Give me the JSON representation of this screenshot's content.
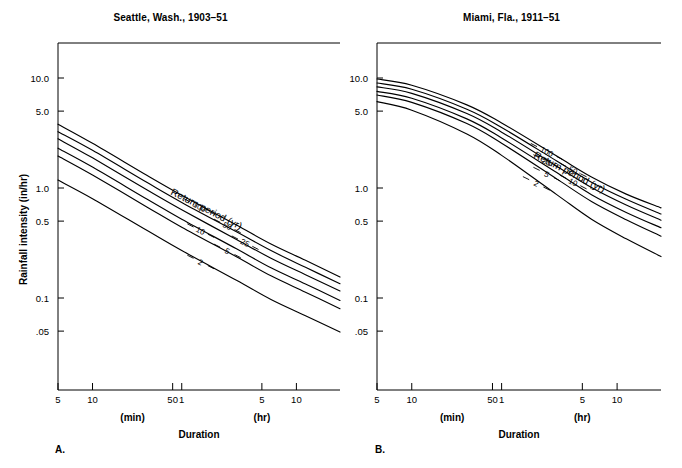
{
  "figure": {
    "ylabel": "Rainfall intensity (in/hr)",
    "xlabel": "Duration",
    "x_unit_min": "(min)",
    "x_unit_hr": "(hr)",
    "return_period_label": "Return period (yr)"
  },
  "panels": [
    {
      "letter": "A.",
      "title": "Seattle, Wash., 1903–51",
      "y_ticks": [
        "10.0",
        "5.0",
        "1.0",
        "0.5",
        "0.1",
        ".05"
      ],
      "x_ticks_min": [
        "5",
        "10",
        "50"
      ],
      "x_ticks_hr": [
        "1",
        "5",
        "10"
      ],
      "curve_labels": [
        "100",
        "50",
        "25",
        "10",
        "5",
        "2"
      ]
    },
    {
      "letter": "B.",
      "title": "Miami, Fla., 1911–51",
      "y_ticks": [
        "10.0",
        "5.0",
        "1.0",
        "0.5",
        "0.1",
        ".05"
      ],
      "x_ticks_min": [
        "5",
        "10",
        "50"
      ],
      "x_ticks_hr": [
        "1",
        "5",
        "10"
      ],
      "curve_labels": [
        "100",
        "50",
        "25",
        "10",
        "5",
        "2"
      ]
    }
  ],
  "chart_data": {
    "type": "line",
    "xlabel": "Duration",
    "ylabel": "Rainfall intensity (in/hr)",
    "xscale": "log",
    "yscale": "log",
    "grid": false,
    "legend": "inline curve labels",
    "x_tick_values_minutes": [
      5,
      10,
      50,
      60,
      300,
      600
    ],
    "x_tick_labels": [
      "5",
      "10",
      "50",
      "1",
      "5",
      "10"
    ],
    "y_tick_values": [
      10.0,
      5.0,
      1.0,
      0.5,
      0.1,
      0.05
    ],
    "y_tick_labels": [
      "10.0",
      "5.0",
      "1.0",
      "0.5",
      "0.1",
      ".05"
    ],
    "ylim": [
      0.03,
      20.0
    ],
    "xlim_minutes": [
      5,
      1440
    ],
    "panels": [
      {
        "name": "Seattle, Wash., 1903–51",
        "letter": "A.",
        "x_minutes": [
          5,
          10,
          30,
          60,
          180,
          360,
          720,
          1440
        ],
        "series": [
          {
            "name": "100",
            "return_period_yr": 100,
            "values": [
              3.8,
              2.55,
              1.3,
              0.86,
              0.46,
              0.31,
              0.22,
              0.155
            ]
          },
          {
            "name": "50",
            "return_period_yr": 50,
            "values": [
              3.25,
              2.2,
              1.12,
              0.74,
              0.4,
              0.27,
              0.19,
              0.135
            ]
          },
          {
            "name": "25",
            "return_period_yr": 25,
            "values": [
              2.8,
              1.88,
              0.96,
              0.635,
              0.34,
              0.23,
              0.163,
              0.116
            ]
          },
          {
            "name": "10",
            "return_period_yr": 10,
            "values": [
              2.3,
              1.55,
              0.79,
              0.52,
              0.28,
              0.188,
              0.134,
              0.095
            ]
          },
          {
            "name": "5",
            "return_period_yr": 5,
            "values": [
              1.95,
              1.31,
              0.67,
              0.44,
              0.237,
              0.159,
              0.113,
              0.08
            ]
          },
          {
            "name": "2",
            "return_period_yr": 2,
            "values": [
              1.18,
              0.8,
              0.41,
              0.27,
              0.145,
              0.097,
              0.069,
              0.049
            ]
          }
        ]
      },
      {
        "name": "Miami, Fla., 1911–51",
        "letter": "B.",
        "x_minutes": [
          5,
          10,
          30,
          60,
          180,
          360,
          720,
          1440
        ],
        "series": [
          {
            "name": "100",
            "return_period_yr": 100,
            "values": [
              9.8,
              8.6,
              5.7,
              3.9,
              1.95,
              1.26,
              0.88,
              0.66
            ]
          },
          {
            "name": "50",
            "return_period_yr": 50,
            "values": [
              9.0,
              7.9,
              5.2,
              3.55,
              1.76,
              1.13,
              0.79,
              0.58
            ]
          },
          {
            "name": "25",
            "return_period_yr": 25,
            "values": [
              8.3,
              7.25,
              4.75,
              3.22,
              1.58,
              1.01,
              0.7,
              0.51
            ]
          },
          {
            "name": "10",
            "return_period_yr": 10,
            "values": [
              7.55,
              6.55,
              4.25,
              2.85,
              1.38,
              0.87,
              0.6,
              0.435
            ]
          },
          {
            "name": "5",
            "return_period_yr": 5,
            "values": [
              7.0,
              6.0,
              3.85,
              2.55,
              1.21,
              0.755,
              0.515,
              0.365
            ]
          },
          {
            "name": "2",
            "return_period_yr": 2,
            "values": [
              6.1,
              5.1,
              3.1,
              1.98,
              0.87,
              0.52,
              0.345,
              0.238
            ]
          }
        ]
      }
    ]
  }
}
